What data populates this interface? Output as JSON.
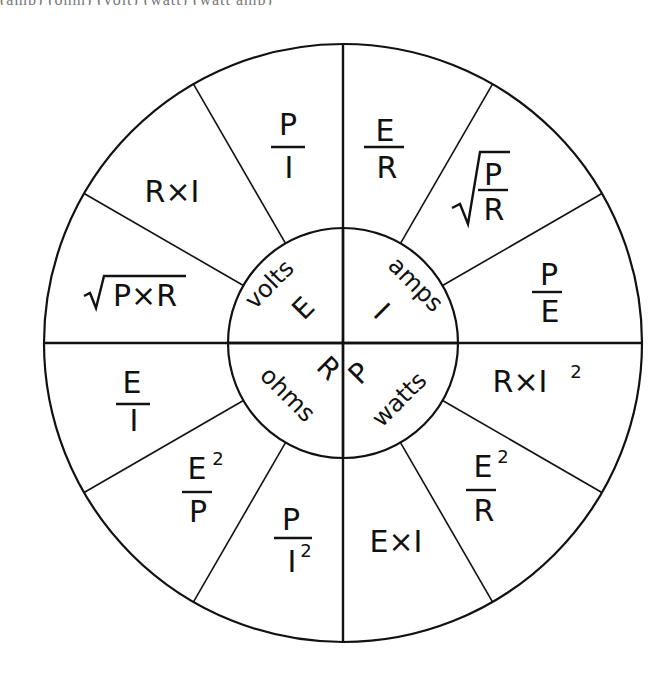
{
  "caption_clipped": "(amp)  (ohm)  (volt)  (watt)                               (watt amp)",
  "wheel": {
    "title": "Ohm's Law / Power Wheel",
    "hub": {
      "top_left": {
        "unit": "volts",
        "symbol": "E"
      },
      "top_right": {
        "unit": "amps",
        "symbol": "I"
      },
      "bottom_left": {
        "unit": "ohms",
        "symbol": "R"
      },
      "bottom_right": {
        "unit": "watts",
        "symbol": "P"
      }
    },
    "sectors": [
      {
        "quantity": "I",
        "type": "frac",
        "num": "E",
        "den": "R"
      },
      {
        "quantity": "I",
        "type": "sqrtfrac",
        "num": "P",
        "den": "R"
      },
      {
        "quantity": "I",
        "type": "frac",
        "num": "P",
        "den": "E"
      },
      {
        "quantity": "P",
        "type": "text",
        "text": "R×I",
        "sup": "2"
      },
      {
        "quantity": "P",
        "type": "frac",
        "num": "E",
        "num_sup": "2",
        "den": "R"
      },
      {
        "quantity": "P",
        "type": "text",
        "text": "E×I"
      },
      {
        "quantity": "R",
        "type": "frac",
        "num": "P",
        "den": "I",
        "den_sup": "2"
      },
      {
        "quantity": "R",
        "type": "frac",
        "num": "E",
        "num_sup": "2",
        "den": "P"
      },
      {
        "quantity": "R",
        "type": "frac",
        "num": "E",
        "den": "I"
      },
      {
        "quantity": "E",
        "type": "sqrt",
        "text": "P×R"
      },
      {
        "quantity": "E",
        "type": "text",
        "text": "R×I"
      },
      {
        "quantity": "E",
        "type": "frac",
        "num": "P",
        "den": "I"
      }
    ],
    "labels": {
      "s0_num": "E",
      "s0_den": "R",
      "s1_num": "P",
      "s1_den": "R",
      "s2_num": "P",
      "s2_den": "E",
      "s3_text": "R×I",
      "s3_sup": "2",
      "s4_num": "E",
      "s4_sup": "2",
      "s4_den": "R",
      "s5_text": "E×I",
      "s6_num": "P",
      "s6_den": "I",
      "s6_sup": "2",
      "s7_num": "E",
      "s7_sup": "2",
      "s7_den": "P",
      "s8_num": "E",
      "s8_den": "I",
      "s9_text": "P×R",
      "s10_text": "R×I",
      "s11_num": "P",
      "s11_den": "I"
    }
  }
}
